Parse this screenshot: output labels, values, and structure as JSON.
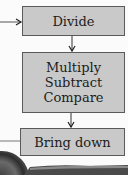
{
  "diagram": {
    "type": "flowchart",
    "nodes": [
      {
        "id": "divide",
        "label": "Divide"
      },
      {
        "id": "multiply_subtract_compare",
        "lines": [
          "Multiply",
          "Subtract",
          "Compare"
        ]
      },
      {
        "id": "bring_down",
        "label": "Bring down"
      }
    ],
    "edges": [
      {
        "from": "external",
        "to": "divide"
      },
      {
        "from": "divide",
        "to": "multiply_subtract_compare"
      },
      {
        "from": "multiply_subtract_compare",
        "to": "bring_down"
      },
      {
        "from": "bring_down",
        "to": "external"
      }
    ],
    "colors": {
      "box_fill": "#c9c9c9",
      "box_border": "#5a5a5a",
      "arrow": "#333333",
      "background": "#fbfbfb"
    }
  }
}
